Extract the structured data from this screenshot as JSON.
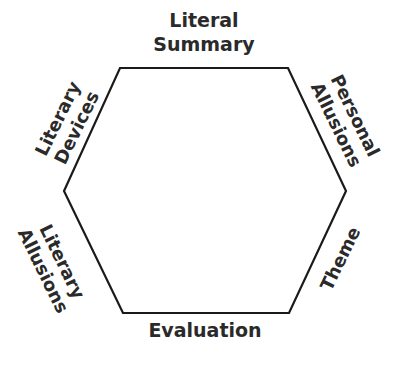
{
  "diagram": {
    "type": "hexagon",
    "stroke_color": "#1a1a1a",
    "text_color": "#2a2a2a",
    "background": "#ffffff",
    "vertices": [
      [
        120,
        68
      ],
      [
        288,
        68
      ],
      [
        346,
        191
      ],
      [
        289,
        313
      ],
      [
        123,
        313
      ],
      [
        64,
        191
      ]
    ],
    "labels": {
      "top": {
        "line1": "Literal",
        "line2": "Summary"
      },
      "upper_right": {
        "line1": "Personal",
        "line2": "Allusions"
      },
      "lower_right": {
        "line1": "Theme"
      },
      "bottom": {
        "line1": "Evaluation"
      },
      "lower_left": {
        "line1": "Literary",
        "line2": "Allusions"
      },
      "upper_left": {
        "line1": "Literary",
        "line2": "Devices"
      }
    }
  }
}
